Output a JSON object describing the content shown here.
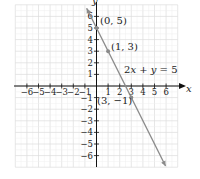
{
  "chart_data": {
    "type": "line",
    "title": "",
    "xlabel": "x",
    "ylabel": "y",
    "xlim": [
      -7,
      7
    ],
    "ylim": [
      -7,
      7
    ],
    "grid": true,
    "x_ticks": [
      -6,
      -5,
      -4,
      -3,
      -2,
      -1,
      1,
      2,
      3,
      4,
      5,
      6
    ],
    "y_ticks": [
      -6,
      -5,
      -4,
      -3,
      -2,
      -1,
      1,
      2,
      3,
      4,
      5,
      6
    ],
    "tick_labels_x": [
      "−6",
      "−5",
      "−4",
      "−3",
      "−2",
      "−1",
      "1",
      "2",
      "3",
      "4",
      "5",
      "6"
    ],
    "tick_labels_y": [
      "−6",
      "−5",
      "−4",
      "−3",
      "−2",
      "−1",
      "1",
      "2",
      "3",
      "4",
      "5",
      "6"
    ],
    "series": [
      {
        "name": "2x + y = 5",
        "x": [
          -1,
          6
        ],
        "y": [
          7,
          -7
        ],
        "color": "#8a8a8a"
      }
    ],
    "points": [
      {
        "x": 0,
        "y": 5,
        "label": "(0, 5)"
      },
      {
        "x": 1,
        "y": 3,
        "label": "(1, 3)"
      },
      {
        "x": 3,
        "y": -1,
        "label": "(3, −1)"
      }
    ],
    "annotations": [
      {
        "text": "2x + y = 5",
        "x": 3.6,
        "y": 1.5
      }
    ]
  },
  "labels": {
    "x_axis": "x",
    "y_axis": "y",
    "equation_parts": [
      "2",
      "x",
      " + ",
      "y",
      " = 5"
    ],
    "point_a": "(0, 5)",
    "point_b": "(1, 3)",
    "point_c": "(3, −1)"
  },
  "colors": {
    "grid": "#dcdcdc",
    "axis": "#111111",
    "line": "#8a8a8a",
    "point": "#8a8a8a"
  }
}
